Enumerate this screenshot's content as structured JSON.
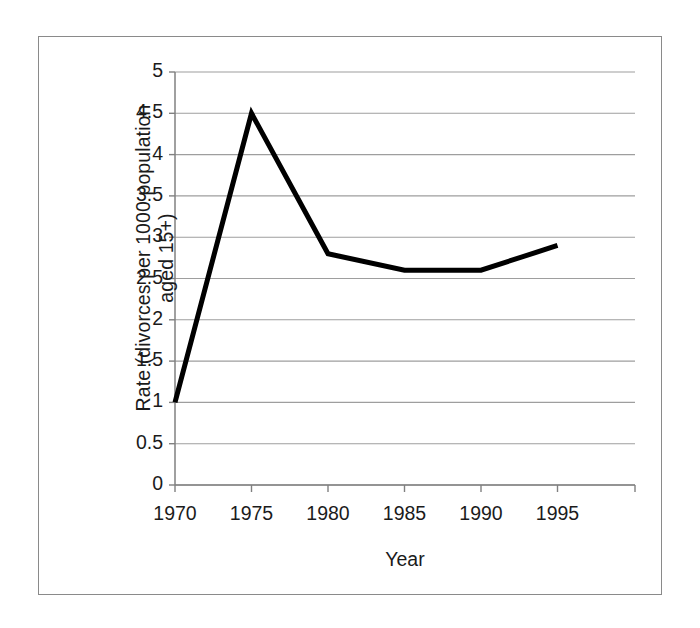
{
  "figure": {
    "frame_color": "#8a8a8a",
    "background": "#ffffff",
    "axis_color": "#808080",
    "gridline_color": "#9e9e9e",
    "series_color": "#000000",
    "text_color": "#1b1b1b"
  },
  "axes": {
    "y_title_line1": "Rate (divorces per 1000 population",
    "y_title_line2": "aged 15+)",
    "x_title": "Year"
  },
  "chart_data": {
    "type": "line",
    "title": "",
    "subtitle": "",
    "xlabel": "Year",
    "ylabel": "Rate (divorces per 1000 population aged 15+)",
    "x": [
      1970,
      1975,
      1980,
      1985,
      1990,
      1995
    ],
    "xtick_labels": [
      "1970",
      "1975",
      "1980",
      "1985",
      "1990",
      "1995"
    ],
    "values": [
      1,
      4.5,
      2.8,
      2.6,
      2.6,
      2.9
    ],
    "series": [
      {
        "name": "Divorce rate",
        "values": [
          1,
          4.5,
          2.8,
          2.6,
          2.6,
          2.9
        ]
      }
    ],
    "ylim": [
      0,
      5
    ],
    "xlim": [
      1970,
      1997
    ],
    "ytick_labels": [
      "5",
      "4.5",
      "4",
      "3.5",
      "3",
      "2.5",
      "2",
      "1.5",
      "1",
      "0.5",
      "0"
    ],
    "yticks": [
      5,
      4.5,
      4,
      3.5,
      3,
      2.5,
      2,
      1.5,
      1,
      0.5,
      0
    ],
    "grid": "horizontal",
    "legend": "none",
    "line_width_px": 5,
    "markers": "none"
  }
}
